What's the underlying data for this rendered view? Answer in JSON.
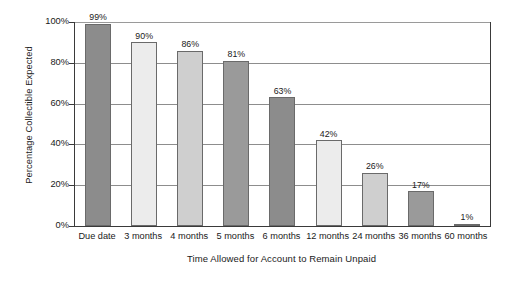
{
  "chart_data": {
    "type": "bar",
    "title": "",
    "xlabel": "Time Allowed for Account to Remain Unpaid",
    "ylabel": "Percentage Collectible Expected",
    "categories": [
      "Due date",
      "3 months",
      "4 months",
      "5 months",
      "6 months",
      "12 months",
      "24 months",
      "36 months",
      "60 months"
    ],
    "values": [
      99,
      90,
      86,
      81,
      63,
      42,
      26,
      17,
      1
    ],
    "value_labels": [
      "99%",
      "90%",
      "86%",
      "81%",
      "63%",
      "42%",
      "26%",
      "17%",
      "1%"
    ],
    "ylim": [
      0,
      100
    ],
    "yticks": [
      0,
      20,
      40,
      60,
      80,
      100
    ],
    "ytick_labels": [
      "0%",
      "20%",
      "40%",
      "60%",
      "80%",
      "100%"
    ],
    "grid": true,
    "legend": "none",
    "bar_colors": [
      "#8c8c8c",
      "#ececec",
      "#cfcfcf",
      "#9a9a9a",
      "#8c8c8c",
      "#ececec",
      "#cfcfcf",
      "#9a9a9a",
      "#8c8c8c"
    ],
    "bar_border_color": "#6a6a6a",
    "axis_color": "#3a3a3a",
    "grid_color": "#8d8d8d",
    "background": "#ffffff"
  }
}
